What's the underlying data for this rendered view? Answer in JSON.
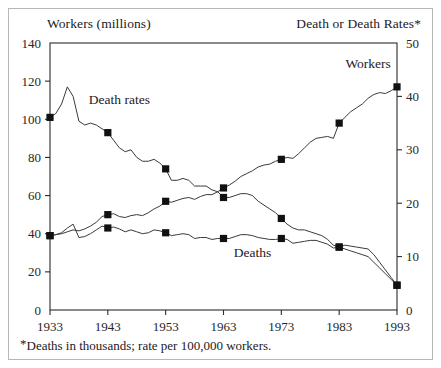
{
  "figure": {
    "left_axis_title": "Workers (millions)",
    "right_axis_title": "Death or Death Rates*",
    "footnote_star": "*",
    "footnote_text": "Deaths in thousands; rate per 100,000 workers.",
    "frame_color": "#2b2b2b",
    "border_color": "#b7b7b7",
    "line_color": "#3a3a3a",
    "marker_color": "#111111",
    "background": "#ffffff"
  },
  "chart_data": {
    "type": "line",
    "title": "",
    "subtitle": "",
    "xlabel": "",
    "ylabel": "Workers (millions)",
    "y2label": "Death or Death Rates*",
    "grid": false,
    "legend_position": "inline-annotations",
    "xlim": [
      1933,
      1993
    ],
    "ylim": [
      0,
      140
    ],
    "y2lim": [
      0,
      50
    ],
    "yticks": [
      0,
      20,
      40,
      60,
      80,
      100,
      120,
      140
    ],
    "y2ticks": [
      0,
      10,
      20,
      30,
      40,
      50
    ],
    "xticks": [
      1933,
      1943,
      1953,
      1963,
      1973,
      1983,
      1993
    ],
    "xticklabels": [
      "1933",
      "1943",
      "1953",
      "1963",
      "1973",
      "1983",
      "1993"
    ],
    "marker_years": [
      1933,
      1943,
      1953,
      1963,
      1973,
      1983,
      1993
    ],
    "annotations": [
      {
        "text": "Death rates",
        "year": 1945,
        "value": 108,
        "axis": "left"
      },
      {
        "text": "Workers",
        "year": 1988,
        "value": 127,
        "axis": "left"
      },
      {
        "text": "Deaths",
        "year": 1968,
        "value": 28,
        "axis": "left"
      }
    ],
    "series": [
      {
        "name": "Workers",
        "axis": "left",
        "unit": "millions",
        "marker": "filled-square",
        "x": [
          1933,
          1934,
          1935,
          1936,
          1937,
          1938,
          1939,
          1940,
          1941,
          1942,
          1943,
          1944,
          1945,
          1946,
          1947,
          1948,
          1949,
          1950,
          1951,
          1952,
          1953,
          1954,
          1955,
          1956,
          1957,
          1958,
          1959,
          1960,
          1961,
          1962,
          1963,
          1964,
          1965,
          1966,
          1967,
          1968,
          1969,
          1970,
          1971,
          1972,
          1973,
          1974,
          1975,
          1976,
          1977,
          1978,
          1979,
          1980,
          1981,
          1982,
          1983,
          1984,
          1985,
          1986,
          1987,
          1988,
          1989,
          1990,
          1991,
          1992,
          1993
        ],
        "values": [
          39,
          39.5,
          40,
          41,
          42,
          41.5,
          42.5,
          44,
          46,
          49,
          50,
          50.5,
          49,
          48.5,
          49.5,
          50,
          49.5,
          51,
          53,
          54.5,
          57,
          56.5,
          57.5,
          58.5,
          59,
          58,
          59.5,
          60.5,
          60.5,
          62,
          64,
          65.5,
          67.5,
          70,
          71.5,
          73,
          75,
          76,
          76.5,
          78,
          79,
          80,
          79.5,
          82,
          85,
          88,
          90,
          90.5,
          91,
          90,
          98,
          101,
          104,
          106,
          108,
          111,
          113,
          114,
          113.5,
          115,
          117
        ]
      },
      {
        "name": "Death rates",
        "axis": "right",
        "unit": "deaths per 100,000 workers",
        "marker": "filled-square",
        "x": [
          1933,
          1934,
          1935,
          1936,
          1937,
          1938,
          1939,
          1940,
          1941,
          1942,
          1943,
          1944,
          1945,
          1946,
          1947,
          1948,
          1949,
          1950,
          1951,
          1952,
          1953,
          1954,
          1955,
          1956,
          1957,
          1958,
          1959,
          1960,
          1961,
          1962,
          1963,
          1964,
          1965,
          1966,
          1967,
          1968,
          1969,
          1970,
          1971,
          1972,
          1973,
          1974,
          1975,
          1976,
          1977,
          1978,
          1979,
          1980,
          1981,
          1982,
          1983,
          1984,
          1985,
          1986,
          1987,
          1988,
          1989,
          1990,
          1991,
          1992,
          1993
        ],
        "values_left_scale": [
          101,
          103,
          108,
          117,
          112,
          99,
          97,
          98,
          97,
          95,
          93,
          89,
          85,
          83,
          84,
          80,
          78,
          78,
          79,
          77,
          74,
          68,
          68,
          69,
          68,
          65,
          65,
          65,
          63,
          62,
          59,
          59,
          60,
          61,
          61,
          60,
          57,
          55,
          53,
          51,
          48,
          45,
          43,
          42,
          42,
          41,
          40,
          39,
          37,
          34,
          33,
          32,
          31,
          30,
          29,
          28,
          25,
          22,
          19,
          16,
          13
        ],
        "values": [
          36.1,
          36.8,
          38.6,
          41.8,
          40.0,
          35.4,
          34.6,
          35.0,
          34.6,
          33.9,
          33.2,
          31.8,
          30.4,
          29.6,
          30.0,
          28.6,
          27.9,
          27.9,
          28.2,
          27.5,
          26.4,
          24.3,
          24.3,
          24.6,
          24.3,
          23.2,
          23.2,
          23.2,
          22.5,
          22.1,
          21.1,
          21.1,
          21.4,
          21.8,
          21.8,
          21.4,
          20.4,
          19.6,
          18.9,
          18.2,
          17.1,
          16.1,
          15.4,
          15.0,
          15.0,
          14.6,
          14.3,
          13.9,
          13.2,
          12.1,
          11.8,
          11.4,
          11.1,
          10.7,
          10.4,
          10.0,
          8.9,
          7.9,
          6.8,
          5.7,
          4.6
        ]
      },
      {
        "name": "Deaths",
        "axis": "right",
        "unit": "thousands",
        "marker": "filled-square",
        "x": [
          1933,
          1934,
          1935,
          1936,
          1937,
          1938,
          1939,
          1940,
          1941,
          1942,
          1943,
          1944,
          1945,
          1946,
          1947,
          1948,
          1949,
          1950,
          1951,
          1952,
          1953,
          1954,
          1955,
          1956,
          1957,
          1958,
          1959,
          1960,
          1961,
          1962,
          1963,
          1964,
          1965,
          1966,
          1967,
          1968,
          1969,
          1970,
          1971,
          1972,
          1973,
          1974,
          1975,
          1976,
          1977,
          1978,
          1979,
          1980,
          1981,
          1982,
          1983,
          1984,
          1985,
          1986,
          1987,
          1988,
          1989,
          1990,
          1991,
          1992,
          1993
        ],
        "values_left_scale": [
          39,
          39.5,
          40.5,
          43,
          45,
          38,
          38.5,
          40,
          42,
          44,
          43,
          43.5,
          42.5,
          41,
          42,
          41,
          40,
          40.5,
          42,
          41.5,
          40.5,
          39,
          39.5,
          40,
          39.5,
          37.5,
          38,
          38,
          37,
          37.5,
          37.5,
          37.5,
          38.5,
          39.5,
          39.5,
          39,
          38,
          37.5,
          37,
          37,
          37.5,
          37,
          35,
          35.5,
          36,
          36.5,
          36.5,
          35.5,
          34.5,
          32.5,
          33,
          34,
          33.5,
          33,
          32.5,
          32,
          29,
          25,
          21,
          17,
          13
        ],
        "values": [
          13.9,
          14.1,
          14.5,
          15.4,
          16.1,
          13.6,
          13.8,
          14.3,
          15.0,
          15.7,
          15.4,
          15.5,
          15.2,
          14.6,
          15.0,
          14.6,
          14.3,
          14.5,
          15.0,
          14.8,
          14.5,
          13.9,
          14.1,
          14.3,
          14.1,
          13.4,
          13.6,
          13.6,
          13.2,
          13.4,
          13.4,
          13.4,
          13.8,
          14.1,
          14.1,
          13.9,
          13.6,
          13.4,
          13.2,
          13.2,
          13.4,
          13.2,
          12.5,
          12.7,
          12.9,
          13.0,
          13.0,
          12.7,
          12.3,
          11.6,
          11.8,
          12.1,
          12.0,
          11.8,
          11.6,
          11.4,
          10.4,
          8.9,
          7.5,
          6.1,
          4.6
        ]
      }
    ]
  }
}
